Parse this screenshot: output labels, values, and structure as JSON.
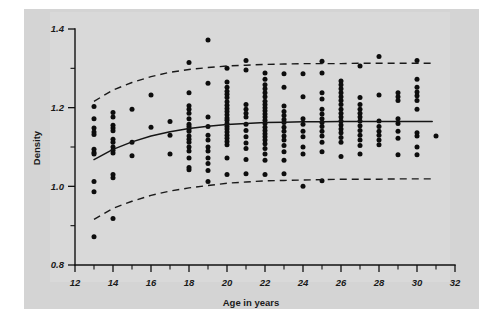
{
  "figure": {
    "background_color": "#d4d4d4",
    "plot_background_color": "#d9d9d9",
    "ink_color": "#111111"
  },
  "chart_data": {
    "type": "scatter",
    "title": "",
    "subtitle": "",
    "xlabel": "Age in years",
    "ylabel": "Density",
    "xlim": [
      12,
      32
    ],
    "ylim": [
      0.8,
      1.4
    ],
    "grid": false,
    "legend": null,
    "x_major_ticks": [
      12,
      14,
      16,
      18,
      20,
      22,
      24,
      26,
      28,
      30,
      32
    ],
    "x_minor_ticks": [
      13,
      15,
      17,
      19,
      21,
      23,
      25,
      27,
      29,
      31
    ],
    "x_tick_labels": [
      "12",
      "14",
      "16",
      "18",
      "20",
      "22",
      "24",
      "26",
      "28",
      "30",
      "32"
    ],
    "y_major_ticks": [
      0.8,
      1.0,
      1.2,
      1.4
    ],
    "y_minor_ticks": [
      0.9,
      1.1,
      1.3
    ],
    "y_tick_labels": [
      "0.8",
      "1.0",
      "1.2",
      "1.4"
    ],
    "annotations": [],
    "series": [
      {
        "name": "observations",
        "type": "scatter",
        "marker": "filled-circle",
        "color": "#0d0d0d",
        "points": [
          [
            13,
            1.203
          ],
          [
            13,
            1.172
          ],
          [
            13,
            1.148
          ],
          [
            13,
            1.138
          ],
          [
            13,
            1.132
          ],
          [
            13,
            1.094
          ],
          [
            13,
            1.086
          ],
          [
            13,
            1.082
          ],
          [
            13,
            1.012
          ],
          [
            13,
            0.986
          ],
          [
            13,
            0.872
          ],
          [
            14,
            1.188
          ],
          [
            14,
            1.176
          ],
          [
            14,
            1.155
          ],
          [
            14,
            1.148
          ],
          [
            14,
            1.141
          ],
          [
            14,
            1.12
          ],
          [
            14,
            1.112
          ],
          [
            14,
            1.1
          ],
          [
            14,
            1.092
          ],
          [
            14,
            1.085
          ],
          [
            14,
            1.03
          ],
          [
            14,
            1.022
          ],
          [
            14,
            0.918
          ],
          [
            15,
            1.196
          ],
          [
            15,
            1.112
          ],
          [
            15,
            1.078
          ],
          [
            16,
            1.232
          ],
          [
            16,
            1.15
          ],
          [
            17,
            1.165
          ],
          [
            17,
            1.13
          ],
          [
            17,
            1.082
          ],
          [
            18,
            1.315
          ],
          [
            18,
            1.238
          ],
          [
            18,
            1.205
          ],
          [
            18,
            1.196
          ],
          [
            18,
            1.186
          ],
          [
            18,
            1.172
          ],
          [
            18,
            1.158
          ],
          [
            18,
            1.152
          ],
          [
            18,
            1.146
          ],
          [
            18,
            1.14
          ],
          [
            18,
            1.128
          ],
          [
            18,
            1.12
          ],
          [
            18,
            1.112
          ],
          [
            18,
            1.1
          ],
          [
            18,
            1.09
          ],
          [
            18,
            1.072
          ],
          [
            18,
            1.048
          ],
          [
            18,
            1.042
          ],
          [
            19,
            1.372
          ],
          [
            19,
            1.262
          ],
          [
            19,
            1.176
          ],
          [
            19,
            1.152
          ],
          [
            19,
            1.13
          ],
          [
            19,
            1.118
          ],
          [
            19,
            1.1
          ],
          [
            19,
            1.09
          ],
          [
            19,
            1.072
          ],
          [
            19,
            1.058
          ],
          [
            19,
            1.04
          ],
          [
            19,
            1.012
          ],
          [
            20,
            1.3
          ],
          [
            20,
            1.265
          ],
          [
            20,
            1.252
          ],
          [
            20,
            1.242
          ],
          [
            20,
            1.234
          ],
          [
            20,
            1.226
          ],
          [
            20,
            1.215
          ],
          [
            20,
            1.206
          ],
          [
            20,
            1.198
          ],
          [
            20,
            1.19
          ],
          [
            20,
            1.182
          ],
          [
            20,
            1.174
          ],
          [
            20,
            1.168
          ],
          [
            20,
            1.16
          ],
          [
            20,
            1.152
          ],
          [
            20,
            1.146
          ],
          [
            20,
            1.138
          ],
          [
            20,
            1.13
          ],
          [
            20,
            1.122
          ],
          [
            20,
            1.114
          ],
          [
            20,
            1.106
          ],
          [
            20,
            1.072
          ],
          [
            20,
            1.03
          ],
          [
            21,
            1.32
          ],
          [
            21,
            1.296
          ],
          [
            21,
            1.208
          ],
          [
            21,
            1.196
          ],
          [
            21,
            1.186
          ],
          [
            21,
            1.176
          ],
          [
            21,
            1.158
          ],
          [
            21,
            1.142
          ],
          [
            21,
            1.126
          ],
          [
            21,
            1.11
          ],
          [
            21,
            1.096
          ],
          [
            21,
            1.068
          ],
          [
            21,
            1.032
          ],
          [
            22,
            1.288
          ],
          [
            22,
            1.272
          ],
          [
            22,
            1.258
          ],
          [
            22,
            1.248
          ],
          [
            22,
            1.238
          ],
          [
            22,
            1.228
          ],
          [
            22,
            1.216
          ],
          [
            22,
            1.208
          ],
          [
            22,
            1.2
          ],
          [
            22,
            1.192
          ],
          [
            22,
            1.184
          ],
          [
            22,
            1.176
          ],
          [
            22,
            1.168
          ],
          [
            22,
            1.16
          ],
          [
            22,
            1.15
          ],
          [
            22,
            1.142
          ],
          [
            22,
            1.134
          ],
          [
            22,
            1.126
          ],
          [
            22,
            1.118
          ],
          [
            22,
            1.108
          ],
          [
            22,
            1.096
          ],
          [
            22,
            1.082
          ],
          [
            22,
            1.066
          ],
          [
            22,
            1.03
          ],
          [
            23,
            1.286
          ],
          [
            23,
            1.252
          ],
          [
            23,
            1.204
          ],
          [
            23,
            1.19
          ],
          [
            23,
            1.18
          ],
          [
            23,
            1.17
          ],
          [
            23,
            1.162
          ],
          [
            23,
            1.15
          ],
          [
            23,
            1.14
          ],
          [
            23,
            1.128
          ],
          [
            23,
            1.118
          ],
          [
            23,
            1.104
          ],
          [
            23,
            1.088
          ],
          [
            23,
            1.066
          ],
          [
            23,
            1.032
          ],
          [
            24,
            1.286
          ],
          [
            24,
            1.228
          ],
          [
            24,
            1.172
          ],
          [
            24,
            1.158
          ],
          [
            24,
            1.14
          ],
          [
            24,
            1.126
          ],
          [
            24,
            1.1
          ],
          [
            24,
            1.082
          ],
          [
            24,
            1.0
          ],
          [
            25,
            1.318
          ],
          [
            25,
            1.288
          ],
          [
            25,
            1.238
          ],
          [
            25,
            1.222
          ],
          [
            25,
            1.196
          ],
          [
            25,
            1.184
          ],
          [
            25,
            1.172
          ],
          [
            25,
            1.162
          ],
          [
            25,
            1.152
          ],
          [
            25,
            1.14
          ],
          [
            25,
            1.128
          ],
          [
            25,
            1.112
          ],
          [
            25,
            1.088
          ],
          [
            25,
            1.014
          ],
          [
            26,
            1.268
          ],
          [
            26,
            1.258
          ],
          [
            26,
            1.248
          ],
          [
            26,
            1.238
          ],
          [
            26,
            1.228
          ],
          [
            26,
            1.218
          ],
          [
            26,
            1.208
          ],
          [
            26,
            1.196
          ],
          [
            26,
            1.186
          ],
          [
            26,
            1.176
          ],
          [
            26,
            1.166
          ],
          [
            26,
            1.156
          ],
          [
            26,
            1.146
          ],
          [
            26,
            1.136
          ],
          [
            26,
            1.124
          ],
          [
            26,
            1.112
          ],
          [
            26,
            1.076
          ],
          [
            27,
            1.306
          ],
          [
            27,
            1.226
          ],
          [
            27,
            1.208
          ],
          [
            27,
            1.196
          ],
          [
            27,
            1.186
          ],
          [
            27,
            1.176
          ],
          [
            27,
            1.166
          ],
          [
            27,
            1.154
          ],
          [
            27,
            1.142
          ],
          [
            27,
            1.13
          ],
          [
            27,
            1.118
          ],
          [
            27,
            1.104
          ],
          [
            27,
            1.082
          ],
          [
            28,
            1.33
          ],
          [
            28,
            1.232
          ],
          [
            28,
            1.166
          ],
          [
            28,
            1.152
          ],
          [
            28,
            1.14
          ],
          [
            28,
            1.13
          ],
          [
            28,
            1.118
          ],
          [
            28,
            1.106
          ],
          [
            29,
            1.238
          ],
          [
            29,
            1.228
          ],
          [
            29,
            1.218
          ],
          [
            29,
            1.172
          ],
          [
            29,
            1.16
          ],
          [
            29,
            1.14
          ],
          [
            29,
            1.122
          ],
          [
            29,
            1.08
          ],
          [
            30,
            1.32
          ],
          [
            30,
            1.272
          ],
          [
            30,
            1.252
          ],
          [
            30,
            1.24
          ],
          [
            30,
            1.23
          ],
          [
            30,
            1.218
          ],
          [
            30,
            1.196
          ],
          [
            30,
            1.136
          ],
          [
            30,
            1.128
          ],
          [
            30,
            1.1
          ],
          [
            30,
            1.08
          ],
          [
            31,
            1.128
          ]
        ]
      },
      {
        "name": "fitted-mean-curve",
        "type": "line",
        "style": "solid",
        "color": "#151515",
        "points": [
          [
            13,
            1.068
          ],
          [
            14,
            1.094
          ],
          [
            15,
            1.113
          ],
          [
            16,
            1.128
          ],
          [
            17,
            1.139
          ],
          [
            18,
            1.147
          ],
          [
            19,
            1.153
          ],
          [
            20,
            1.157
          ],
          [
            21,
            1.16
          ],
          [
            22,
            1.162
          ],
          [
            23,
            1.163
          ],
          [
            24,
            1.164
          ],
          [
            25,
            1.164
          ],
          [
            26,
            1.165
          ],
          [
            27,
            1.165
          ],
          [
            28,
            1.165
          ],
          [
            29,
            1.165
          ],
          [
            30,
            1.165
          ],
          [
            30.8,
            1.165
          ]
        ]
      },
      {
        "name": "upper-reference-band",
        "type": "line",
        "style": "dashed",
        "color": "#1a1a1a",
        "points": [
          [
            13,
            1.216
          ],
          [
            14,
            1.245
          ],
          [
            15,
            1.264
          ],
          [
            16,
            1.279
          ],
          [
            17,
            1.29
          ],
          [
            18,
            1.297
          ],
          [
            19,
            1.302
          ],
          [
            20,
            1.306
          ],
          [
            21,
            1.308
          ],
          [
            22,
            1.31
          ],
          [
            23,
            1.311
          ],
          [
            24,
            1.312
          ],
          [
            25,
            1.312
          ],
          [
            26,
            1.312
          ],
          [
            27,
            1.313
          ],
          [
            28,
            1.313
          ],
          [
            29,
            1.313
          ],
          [
            30,
            1.313
          ],
          [
            30.8,
            1.313
          ]
        ]
      },
      {
        "name": "lower-reference-band",
        "type": "line",
        "style": "dashed",
        "color": "#1a1a1a",
        "points": [
          [
            13,
            0.916
          ],
          [
            14,
            0.944
          ],
          [
            15,
            0.962
          ],
          [
            16,
            0.977
          ],
          [
            17,
            0.988
          ],
          [
            18,
            0.996
          ],
          [
            19,
            1.002
          ],
          [
            20,
            1.008
          ],
          [
            21,
            1.011
          ],
          [
            22,
            1.014
          ],
          [
            23,
            1.015
          ],
          [
            24,
            1.016
          ],
          [
            25,
            1.017
          ],
          [
            26,
            1.018
          ],
          [
            27,
            1.018
          ],
          [
            28,
            1.018
          ],
          [
            29,
            1.019
          ],
          [
            30,
            1.019
          ],
          [
            30.8,
            1.019
          ]
        ]
      }
    ]
  }
}
